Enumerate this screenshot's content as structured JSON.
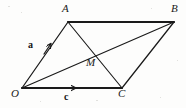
{
  "figure": {
    "type": "geometry-diagram",
    "shape_name": "parallelogram",
    "width": 186,
    "height": 108,
    "background_color": "#fdfdfc",
    "stroke_color": "#1a1a1a",
    "vertices": [
      {
        "name": "O",
        "label": "O",
        "x": 22,
        "y": 88,
        "label_x": 11,
        "label_y": 90
      },
      {
        "name": "A",
        "label": "A",
        "x": 68,
        "y": 22,
        "label_x": 63,
        "label_y": 4
      },
      {
        "name": "B",
        "label": "B",
        "x": 174,
        "y": 22,
        "label_x": 172,
        "label_y": 4
      },
      {
        "name": "C",
        "label": "C",
        "x": 122,
        "y": 88,
        "label_x": 119,
        "label_y": 90
      }
    ],
    "interior_points": [
      {
        "name": "M",
        "label": "M",
        "x": 88,
        "y": 55,
        "label_x": 88,
        "label_y": 57
      }
    ],
    "edges": [
      {
        "name": "edge-OA",
        "from": "O",
        "to": "A",
        "weight": "thin",
        "arrow": true,
        "arrow_t": 0.62
      },
      {
        "name": "edge-AB",
        "from": "A",
        "to": "B",
        "weight": "bold",
        "arrow": false
      },
      {
        "name": "edge-BC",
        "from": "B",
        "to": "C",
        "weight": "thin",
        "arrow": false
      },
      {
        "name": "edge-OC",
        "from": "O",
        "to": "C",
        "weight": "bold",
        "arrow": true,
        "arrow_t": 0.58
      }
    ],
    "diagonals": [
      {
        "name": "diagonal-OB",
        "from": "O",
        "to": "B",
        "weight": "thin",
        "arrow": false
      },
      {
        "name": "diagonal-AC",
        "from": "A",
        "to": "C",
        "weight": "thin",
        "arrow": false
      }
    ],
    "vector_labels": [
      {
        "name": "vector-a",
        "label": "a",
        "x": 31,
        "y": 44,
        "on_edge": "edge-OA"
      },
      {
        "name": "vector-c",
        "label": "c",
        "x": 66,
        "y": 93,
        "on_edge": "edge-OC"
      }
    ]
  }
}
